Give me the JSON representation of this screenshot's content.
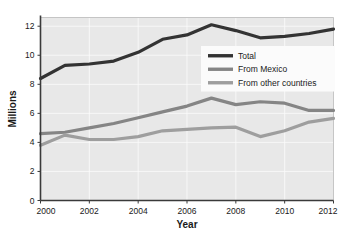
{
  "chart_data": {
    "type": "line",
    "title": "",
    "xlabel": "Year",
    "ylabel": "Millions",
    "x": [
      2000,
      2001,
      2002,
      2003,
      2004,
      2005,
      2006,
      2007,
      2008,
      2009,
      2010,
      2011,
      2012
    ],
    "xlim": [
      2000,
      2012
    ],
    "ylim": [
      0,
      12.6
    ],
    "xticks": [
      2000,
      2002,
      2004,
      2006,
      2008,
      2010,
      2012
    ],
    "xtick_labels": [
      "2000",
      "2002",
      "2004",
      "2006",
      "2008",
      "2010",
      "2012"
    ],
    "yticks": [
      0,
      2,
      4,
      6,
      8,
      10,
      12
    ],
    "ytick_labels": [
      "0",
      "2",
      "4",
      "6",
      "8",
      "10",
      "12"
    ],
    "grid": true,
    "legend_position": "upper right inside",
    "series": [
      {
        "name": "Total",
        "color": "#333333",
        "linewidth": 3.2,
        "values": [
          8.4,
          9.3,
          9.4,
          9.6,
          10.2,
          11.1,
          11.4,
          12.1,
          11.7,
          11.2,
          11.3,
          11.5,
          11.8
        ]
      },
      {
        "name": "From Mexico",
        "color": "#858585",
        "linewidth": 3.2,
        "values": [
          4.6,
          4.7,
          5.0,
          5.3,
          5.7,
          6.1,
          6.5,
          7.05,
          6.6,
          6.8,
          6.7,
          6.2,
          6.2
        ]
      },
      {
        "name": "From other countries",
        "color": "#9e9e9e",
        "linewidth": 3.2,
        "values": [
          3.8,
          4.5,
          4.2,
          4.2,
          4.4,
          4.8,
          4.9,
          5.0,
          5.05,
          4.4,
          4.8,
          5.4,
          5.65
        ]
      }
    ]
  },
  "legend": {
    "items": [
      {
        "label": "Total",
        "color": "#333333"
      },
      {
        "label": "From Mexico",
        "color": "#858585"
      },
      {
        "label": "From other countries",
        "color": "#9e9e9e"
      }
    ]
  },
  "axes": {
    "x_title": "Year",
    "y_title": "Millions"
  },
  "colors": {
    "plot_background": "#e8e8e8",
    "page_background": "#ffffff",
    "gridline": "#fbfbfb",
    "spine": "#3a3a3a",
    "text": "#1a1a1a",
    "legend_background": "#fbfbfb"
  }
}
